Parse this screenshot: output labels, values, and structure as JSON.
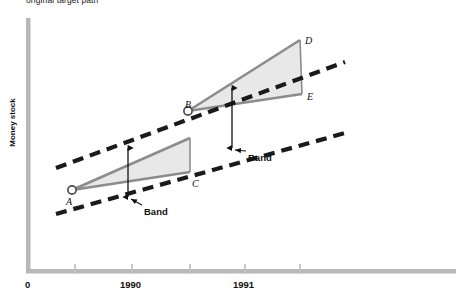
{
  "figure": {
    "caption_top": "original target path",
    "ylabel": "Money stock",
    "background": "#ffffff"
  },
  "colors": {
    "axis": "#b3b3b3",
    "cone_fill": "#e8e8e8",
    "cone_edge": "#8c8c8c",
    "dashed_line": "#1a1a1a",
    "text": "#111111"
  },
  "axes": {
    "x_ticks": [
      {
        "label": "0",
        "x": 28
      },
      {
        "label": "",
        "x": 75
      },
      {
        "label": "1990",
        "x": 132
      },
      {
        "label": "",
        "x": 190
      },
      {
        "label": "1991",
        "x": 245
      },
      {
        "label": "",
        "x": 300
      }
    ],
    "origin_label": "0"
  },
  "chart_data": {
    "type": "line",
    "title": "original target path",
    "xlabel": "",
    "ylabel": "Money stock",
    "grid": false,
    "legend": null,
    "xlim": [
      0,
      461
    ],
    "ylim": [
      0,
      304
    ],
    "points": [
      {
        "name": "A",
        "x": 72,
        "y": 190,
        "marker": "open-circle",
        "label_dx": -6,
        "label_dy": 12
      },
      {
        "name": "B",
        "x": 188,
        "y": 111,
        "marker": "open-circle",
        "label_dx": -3,
        "label_dy": -6
      },
      {
        "name": "C",
        "x": 190,
        "y": 172,
        "marker": "none",
        "label_dx": 2,
        "label_dy": 12
      },
      {
        "name": "D",
        "x": 300,
        "y": 40,
        "marker": "none",
        "label_dx": 5,
        "label_dy": 1
      },
      {
        "name": "E",
        "x": 302,
        "y": 94,
        "marker": "none",
        "label_dx": 5,
        "label_dy": 3
      }
    ],
    "cones": [
      {
        "name": "first-target-cone",
        "apex": [
          72,
          190
        ],
        "upper_end": [
          190,
          138
        ],
        "lower_end": [
          190,
          172
        ],
        "fill": "#e8e8e8",
        "edge": "#8c8c8c"
      },
      {
        "name": "second-target-cone",
        "apex": [
          188,
          111
        ],
        "upper_end": [
          300,
          40
        ],
        "lower_end": [
          302,
          94
        ],
        "fill": "#e8e8e8",
        "edge": "#8c8c8c"
      }
    ],
    "dashed_lines": [
      {
        "name": "upper-band-line",
        "x1": 56,
        "y1": 168,
        "x2": 345,
        "y2": 62
      },
      {
        "name": "lower-band-line",
        "x1": 56,
        "y1": 214,
        "x2": 345,
        "y2": 133
      }
    ],
    "band_arrows": [
      {
        "name": "band-arrow-left",
        "x": 128,
        "y_top": 148,
        "y_bottom": 197,
        "label": "Band",
        "label_x": 144,
        "label_y": 213
      },
      {
        "name": "band-arrow-right",
        "x": 232,
        "y_top": 88,
        "y_bottom": 148,
        "label": "Band",
        "label_x": 248,
        "label_y": 159
      }
    ]
  }
}
